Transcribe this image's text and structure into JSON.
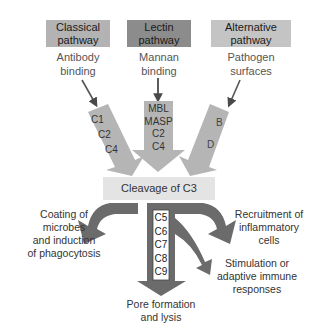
{
  "pathways": [
    {
      "title_line1": "Classical",
      "title_line2": "pathway",
      "trigger_line1": "Antibody",
      "trigger_line2": "binding",
      "components": [
        "C1",
        "C2",
        "C4"
      ],
      "box_color": "#b3b3b3"
    },
    {
      "title_line1": "Lectin",
      "title_line2": "pathway",
      "trigger_line1": "Mannan",
      "trigger_line2": "binding",
      "components": [
        "MBL",
        "MASP",
        "C2",
        "C4"
      ],
      "box_color": "#8c8c8c"
    },
    {
      "title_line1": "Alternative",
      "title_line2": "pathway",
      "trigger_line1": "Pathogen",
      "trigger_line2": "surfaces",
      "components": [
        "B",
        "D"
      ],
      "box_color": "#c4c4c4"
    }
  ],
  "central": {
    "label": "Cleavage of C3",
    "color": "#e6e6e6"
  },
  "terminal_components": [
    "C5",
    "C6",
    "C7",
    "C8",
    "C9"
  ],
  "outcomes": {
    "left": [
      "Coating of",
      "microbes",
      "and induction",
      "of phagocytosis"
    ],
    "right_top": [
      "Recruitment of",
      "inflammatory",
      "cells"
    ],
    "right_bottom": [
      "Stimulation or",
      "adaptive immune",
      "responses"
    ],
    "bottom": [
      "Pore formation",
      "and lysis"
    ]
  },
  "colors": {
    "input_arrow": "#b5b5b5",
    "output_arrow": "#6b6b6b",
    "thin_arrow": "#555555"
  }
}
